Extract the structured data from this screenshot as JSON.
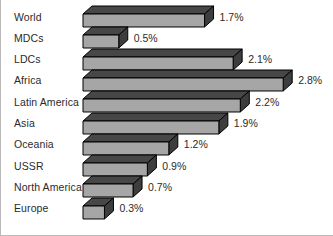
{
  "chart_data": {
    "type": "bar",
    "orientation": "horizontal",
    "title": "",
    "subtitle": "",
    "xlabel": "",
    "ylabel": "",
    "grid": false,
    "legend": false,
    "xlim": [
      0,
      3.0
    ],
    "value_suffix": "%",
    "categories": [
      "World",
      "MDCs",
      "LDCs",
      "Africa",
      "Latin America",
      "Asia",
      "Oceania",
      "USSR",
      "North America",
      "Europe"
    ],
    "values": [
      1.7,
      0.5,
      2.1,
      2.8,
      2.2,
      1.9,
      1.2,
      0.9,
      0.7,
      0.3
    ],
    "data_labels": [
      "1.7%",
      "0.5%",
      "2.1%",
      "2.8%",
      "2.2%",
      "1.9%",
      "1.2%",
      "0.9%",
      "0.7%",
      "0.3%"
    ],
    "bars": [
      {
        "label": "World",
        "value": 1.7,
        "display": "1.7%"
      },
      {
        "label": "MDCs",
        "value": 0.5,
        "display": "0.5%"
      },
      {
        "label": "LDCs",
        "value": 2.1,
        "display": "2.1%"
      },
      {
        "label": "Africa",
        "value": 2.8,
        "display": "2.8%"
      },
      {
        "label": "Latin America",
        "value": 2.2,
        "display": "2.2%"
      },
      {
        "label": "Asia",
        "value": 1.9,
        "display": "1.9%"
      },
      {
        "label": "Oceania",
        "value": 1.2,
        "display": "1.2%"
      },
      {
        "label": "USSR",
        "value": 0.9,
        "display": "0.9%"
      },
      {
        "label": "North America",
        "value": 0.7,
        "display": "0.7%"
      },
      {
        "label": "Europe",
        "value": 0.3,
        "display": "0.3%"
      }
    ]
  },
  "style": {
    "bar_face": "#a6a6a6",
    "bar_top": "#474747",
    "bar_side": "#3d3d3d",
    "bar_outline": "#000000",
    "text_color": "#2b2b2b",
    "background": "#ffffff",
    "border_color": "#b9b9b9"
  }
}
